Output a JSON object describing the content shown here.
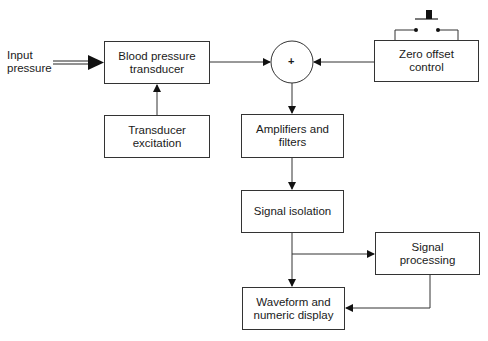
{
  "diagram": {
    "input_label": "Input\npressure",
    "sum_symbol": "+",
    "blocks": {
      "transducer": "Blood pressure\ntransducer",
      "excitation": "Transducer\nexcitation",
      "zero_offset": "Zero offset\ncontrol",
      "amplifiers": "Amplifiers and\nfilters",
      "isolation": "Signal isolation",
      "processing": "Signal\nprocessing",
      "display": "Waveform and\nnumeric display"
    },
    "colors": {
      "line": "#333333",
      "background": "#ffffff"
    }
  }
}
